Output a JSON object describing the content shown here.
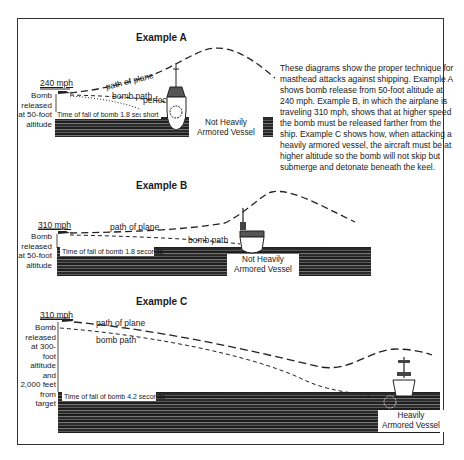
{
  "description": "These diagrams show the proper technique for masthead attacks against shipping. Example A shows bomb release from 50-foot altitude at 240 mph. Example B, in which the airplane is traveling 310 mph, shows that at higher speed the bomb must be released farther from the ship. Example C shows how, when attacking a heavily armored vessel, the aircraft must be at higher altitude so the bomb will not skip but submerge and detonate beneath the keel.",
  "examples": [
    {
      "title": "Example A",
      "speed": "240 mph",
      "release_lines": [
        "Bomb",
        "released",
        "at 50-foot",
        "altitude"
      ],
      "path_of_plane": "path of plane",
      "bomb_path": "bomb path",
      "perfect": "perfect",
      "short": "short",
      "time_of_fall": "Time of fall of bomb 1.8 seconds",
      "vessel_lines": [
        "Not Heavily",
        "Armored Vessel"
      ]
    },
    {
      "title": "Example B",
      "speed": "310 mph",
      "release_lines": [
        "Bomb",
        "released",
        "at 50-foot",
        "altitude"
      ],
      "path_of_plane": "path of plane",
      "bomb_path": "bomb path",
      "time_of_fall": "Time of fall of bomb 1.8 seconds",
      "vessel_lines": [
        "Not Heavily",
        "Armored Vessel"
      ]
    },
    {
      "title": "Example C",
      "speed": "310 mph",
      "release_lines": [
        "Bomb",
        "released",
        "at 300-foot",
        "altitude and",
        "2,000 feet",
        "from target"
      ],
      "path_of_plane": "path of plane",
      "bomb_path": "bomb path",
      "time_of_fall": "Time of fall of bomb 4.2 seconds",
      "vessel_lines": [
        "Heavily",
        "Armored Vessel"
      ]
    }
  ]
}
